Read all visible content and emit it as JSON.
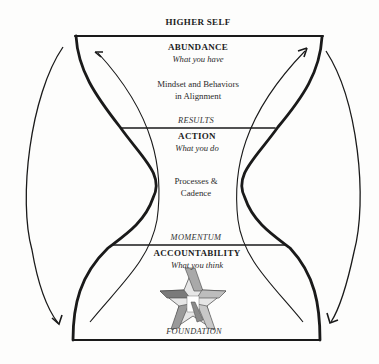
{
  "diagram": {
    "top_label": "HIGHER SELF",
    "sections": [
      {
        "title": "ABUNDANCE",
        "subtitle": "What you have",
        "body_line1": "Mindset and Behaviors",
        "body_line2": "in Alignment"
      },
      {
        "title": "ACTION",
        "subtitle": "What you do",
        "body_line1": "Processes &",
        "body_line2": "Cadence"
      },
      {
        "title": "ACCOUNTABILITY",
        "subtitle": "What you think"
      }
    ],
    "boundaries": {
      "results": "RESULTS",
      "momentum": "MOMENTUM",
      "foundation": "FOUNDATION"
    },
    "icons": {
      "star": "interlocking-star-logo"
    },
    "colors": {
      "line": "#1a1a1a",
      "star_light": "#d4d4d4",
      "star_mid": "#a9a9a9",
      "star_dark": "#7a7a7a"
    }
  }
}
